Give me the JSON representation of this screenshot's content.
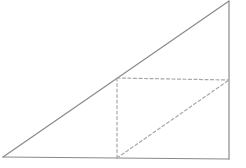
{
  "diagram": {
    "type": "geometry",
    "colors": {
      "solid_stroke": "#8a8a8a",
      "dashed_stroke": "#a8a8a8",
      "background": "#ffffff"
    },
    "points": {
      "A": [
        3,
        157
      ],
      "B": [
        229,
        159
      ],
      "C": [
        229,
        1
      ],
      "D": [
        117,
        78
      ],
      "E": [
        229,
        80
      ],
      "F": [
        117,
        158
      ]
    },
    "solid_segments": [
      {
        "from": "A",
        "to": "C",
        "label": "hypotenuse"
      },
      {
        "from": "A",
        "to": "B",
        "label": "base"
      },
      {
        "from": "B",
        "to": "C",
        "label": "right-leg"
      }
    ],
    "dashed_segments": [
      {
        "from": "D",
        "to": "E",
        "label": "rectangle-top"
      },
      {
        "from": "D",
        "to": "F",
        "label": "rectangle-left"
      },
      {
        "from": "F",
        "to": "E",
        "label": "rectangle-diagonal"
      }
    ]
  }
}
